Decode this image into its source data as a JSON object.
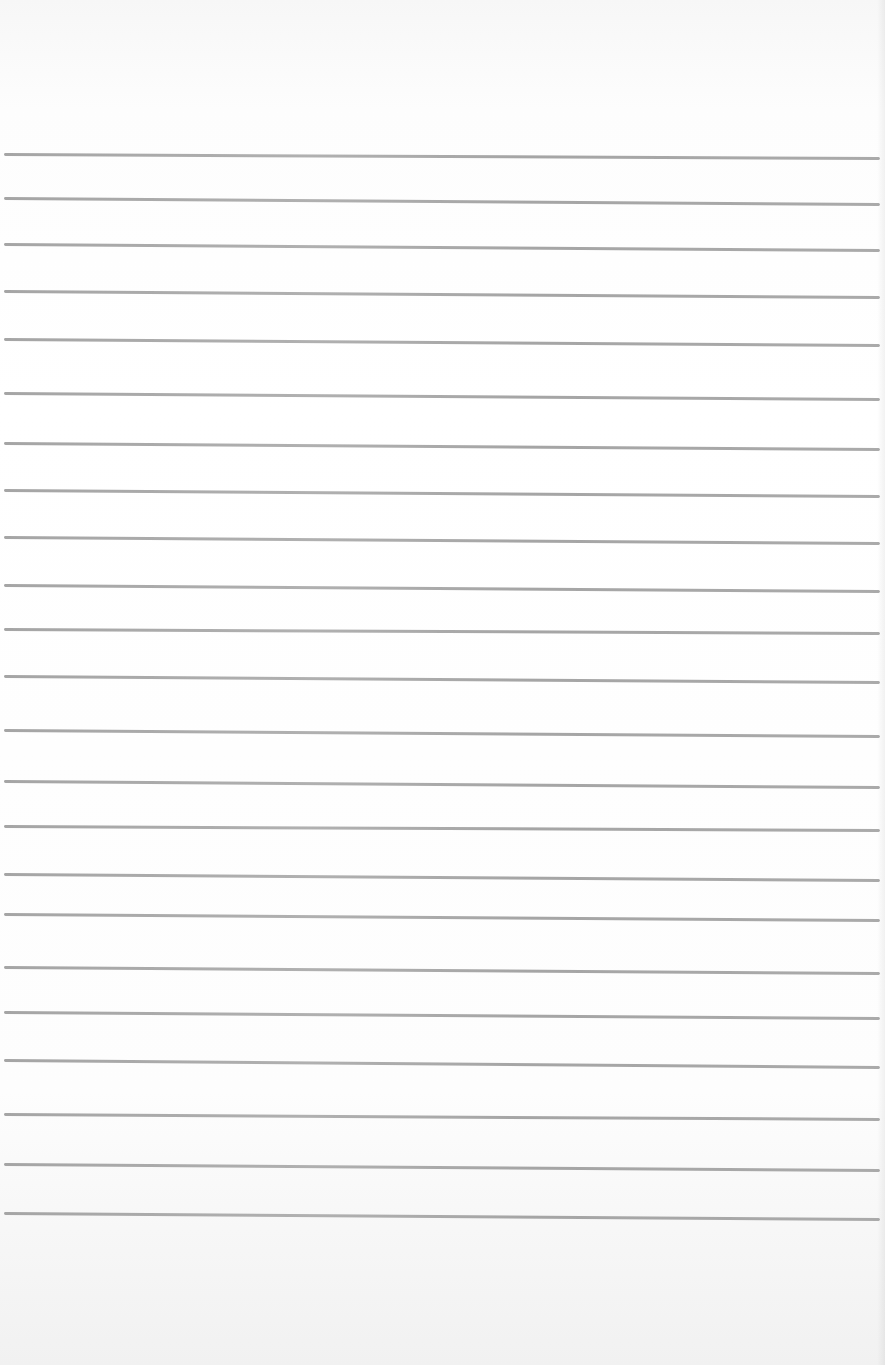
{
  "paper": {
    "background_color": "#fbfbfb",
    "line_color": "#a5a5a5",
    "lines": [
      {
        "y": 153,
        "tilt": 4
      },
      {
        "y": 197,
        "tilt": 6
      },
      {
        "y": 243,
        "tilt": 6
      },
      {
        "y": 290,
        "tilt": 6
      },
      {
        "y": 338,
        "tilt": 6
      },
      {
        "y": 392,
        "tilt": 6
      },
      {
        "y": 442,
        "tilt": 6
      },
      {
        "y": 489,
        "tilt": 6
      },
      {
        "y": 536,
        "tilt": 6
      },
      {
        "y": 584,
        "tilt": 6
      },
      {
        "y": 628,
        "tilt": 4
      },
      {
        "y": 675,
        "tilt": 6
      },
      {
        "y": 729,
        "tilt": 6
      },
      {
        "y": 780,
        "tilt": 6
      },
      {
        "y": 825,
        "tilt": 4
      },
      {
        "y": 873,
        "tilt": 6
      },
      {
        "y": 913,
        "tilt": 6
      },
      {
        "y": 966,
        "tilt": 6
      },
      {
        "y": 1011,
        "tilt": 6
      },
      {
        "y": 1059,
        "tilt": 7
      },
      {
        "y": 1113,
        "tilt": 5
      },
      {
        "y": 1163,
        "tilt": 6
      },
      {
        "y": 1212,
        "tilt": 6
      }
    ]
  }
}
